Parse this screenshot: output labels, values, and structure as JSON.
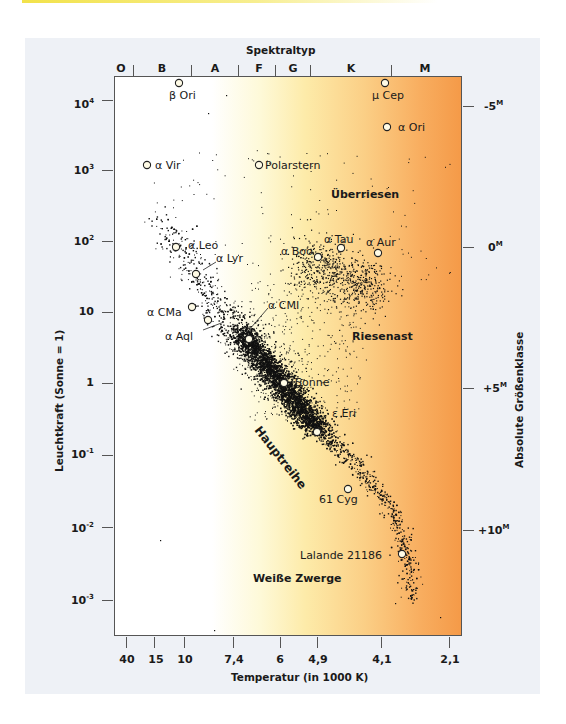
{
  "chart_data": {
    "type": "scatter",
    "top_axis": {
      "label": "Spektraltyp",
      "classes": [
        "O",
        "B",
        "A",
        "F",
        "G",
        "K",
        "M"
      ]
    },
    "xlabel": "Temperatur (in 1000 K)",
    "x_ticks": [
      "40",
      "15",
      "10",
      "7,4",
      "6",
      "4,9",
      "4,1",
      "2,1"
    ],
    "ylabel": "Leuchtkraft (Sonne = 1)",
    "y_ticks": [
      "10^4",
      "10^3",
      "10^2",
      "10",
      "1",
      "10^-1",
      "10^-2",
      "10^-3"
    ],
    "y2label": "Absolute Größenklasse",
    "y2_ticks": [
      "-5M",
      "0M",
      "+5M",
      "+10M"
    ],
    "regions": [
      "Überriesen",
      "Riesenast",
      "Hauptreihe",
      "Weiße Zwerge"
    ],
    "named_stars": [
      {
        "name": "β Ori",
        "temp_k": 12000,
        "luminosity": 20000
      },
      {
        "name": "μ Cep",
        "temp_k": 3700,
        "luminosity": 20000
      },
      {
        "name": "α Ori",
        "temp_k": 3600,
        "luminosity": 4000
      },
      {
        "name": "α Vir",
        "temp_k": 22000,
        "luminosity": 1200
      },
      {
        "name": "Polarstern",
        "temp_k": 6600,
        "luminosity": 1200
      },
      {
        "name": "α Leo",
        "temp_k": 12500,
        "luminosity": 85
      },
      {
        "name": "α Lyr",
        "temp_k": 9500,
        "luminosity": 35
      },
      {
        "name": "α Boo",
        "temp_k": 4400,
        "luminosity": 55
      },
      {
        "name": "α Tau",
        "temp_k": 4000,
        "luminosity": 80
      },
      {
        "name": "α Aur",
        "temp_k": 4100,
        "luminosity": 70
      },
      {
        "name": "α CMa",
        "temp_k": 9800,
        "luminosity": 12
      },
      {
        "name": "α CMI",
        "temp_k": 6700,
        "luminosity": 8
      },
      {
        "name": "α Aql",
        "temp_k": 7200,
        "luminosity": 5
      },
      {
        "name": "Sonne",
        "temp_k": 6000,
        "luminosity": 1
      },
      {
        "name": "ε Eri",
        "temp_k": 4900,
        "luminosity": 0.3
      },
      {
        "name": "61 Cyg",
        "temp_k": 4400,
        "luminosity": 0.03
      },
      {
        "name": "Lalande 21186",
        "temp_k": 3400,
        "luminosity": 0.004
      }
    ],
    "grid": false,
    "background": "temperature color gradient white→yellow→orange"
  },
  "labels": {
    "spektraltyp": "Spektraltyp",
    "xlabel": "Temperatur (in 1000 K)",
    "ylabel": "Leuchtkraft (Sonne = 1)",
    "y2label": "Absolute Größenklasse",
    "spectral": [
      "O",
      "B",
      "A",
      "F",
      "G",
      "K",
      "M"
    ],
    "xticks": [
      "40",
      "15",
      "10",
      "7,4",
      "6",
      "4,9",
      "4,1",
      "2,1"
    ],
    "yticks": [
      "10",
      "10",
      "10",
      "10",
      "1",
      "10",
      "10",
      "10"
    ],
    "yexp": [
      "4",
      "3",
      "2",
      "",
      "",
      "-1",
      "-2",
      "-3"
    ],
    "y2ticks": [
      "-5",
      "0",
      "+5",
      "+10"
    ],
    "y2sup": "M",
    "regions": {
      "ueberriesen": "Überriesen",
      "riesenast": "Riesenast",
      "hauptreihe": "Hauptreihe",
      "weisse_zwerge": "Weiße Zwerge"
    },
    "stars": {
      "beta_ori": "β Ori",
      "mu_cep": "μ Cep",
      "alpha_ori": "α Ori",
      "alpha_vir": "α Vir",
      "polarstern": "Polarstern",
      "alpha_leo": "α Leo",
      "alpha_lyr": "α Lyr",
      "alpha_boo": "α Boo",
      "alpha_tau": "α Tau",
      "alpha_aur": "α Aur",
      "alpha_cma": "α CMa",
      "alpha_cmi": "α CMI",
      "alpha_aql": "α Aql",
      "sonne": "Sonne",
      "eps_eri": "ε Eri",
      "cyg61": "61 Cyg",
      "lalande": "Lalande 21186"
    }
  },
  "colors": {
    "panel": "#eef1f6",
    "gradient_hot": "#ffffff",
    "gradient_mid": "#fdeba9",
    "gradient_cool": "#f59a48",
    "points": "#111111"
  }
}
